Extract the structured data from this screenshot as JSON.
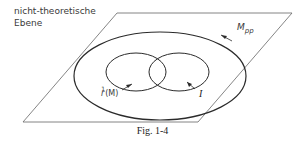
{
  "plane": {
    "label_line1": "nicht-theoretische",
    "label_line2": "Ebene"
  },
  "sets": {
    "outer": {
      "label": "M",
      "subscript": "pp"
    },
    "left": {
      "label_prefix": "r",
      "superscript": "1",
      "label_suffix": "(M)"
    },
    "right": {
      "label": "I"
    }
  },
  "caption": "Fig. 1-4",
  "colors": {
    "stroke": "#2b2b2b",
    "plane_stroke": "#555555"
  }
}
